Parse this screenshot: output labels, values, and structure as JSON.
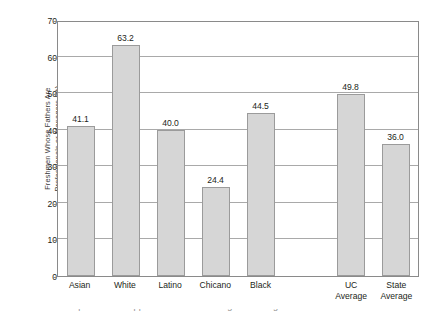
{
  "chart_data": {
    "type": "bar",
    "title": "",
    "subtitle": "",
    "xlabel": "",
    "ylabel": "Freshmen Whose Fathers Are Professionals or Managers (%)",
    "ylabel_lines": [
      "Freshmen Whose Fathers Are",
      "Professionals or Managers (%)"
    ],
    "categories": [
      "Asian",
      "White",
      "Latino",
      "Chicano",
      "Black",
      "UC Average",
      "State Average"
    ],
    "category_lines": [
      [
        "Asian"
      ],
      [
        "White"
      ],
      [
        "Latino"
      ],
      [
        "Chicano"
      ],
      [
        "Black"
      ],
      [
        "UC",
        "Average"
      ],
      [
        "State",
        "Average"
      ]
    ],
    "values": [
      41.1,
      63.2,
      40.0,
      24.4,
      44.5,
      49.8,
      36.0
    ],
    "value_labels": [
      "41.1",
      "63.2",
      "40.0",
      "24.4",
      "44.5",
      "49.8",
      "36.0"
    ],
    "ylim": [
      0,
      70
    ],
    "yticks": [
      0,
      10,
      20,
      30,
      40,
      50,
      60,
      70
    ],
    "ytick_labels": [
      "0",
      "10",
      "20",
      "30",
      "40",
      "50",
      "60",
      "70"
    ],
    "grid": true,
    "grid_axis": "y",
    "legend": false,
    "legend_position": "none",
    "gap_after_index": 4,
    "bar_color": "#d6d6d6",
    "bar_edge_color": "#9b9b9b",
    "axis_color": "#8a8a8a",
    "grid_color": "#a9a9a9",
    "text_color": "#231f20",
    "background": "#ffffff"
  },
  "caption_sliver": "a caption line cropped at the bottom edge of the figure"
}
